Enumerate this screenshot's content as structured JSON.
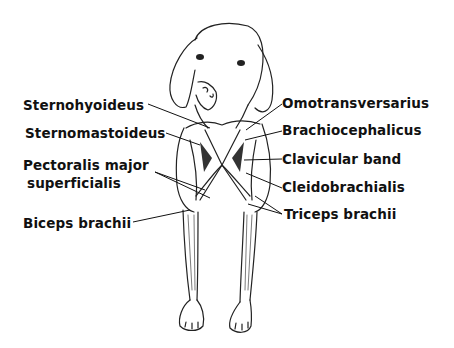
{
  "labels_left": [
    {
      "id": "sternohyoideus",
      "text": "Sternohyoideus",
      "x": 23,
      "y": 98
    },
    {
      "id": "sternomastoideus",
      "text": "Sternomastoideus",
      "x": 25,
      "y": 126
    },
    {
      "id": "pectoralis-line1",
      "text": "Pectoralis major",
      "x": 23,
      "y": 158
    },
    {
      "id": "pectoralis-line2",
      "text": "superficialis",
      "x": 27,
      "y": 176
    },
    {
      "id": "biceps-brachii",
      "text": "Biceps brachii",
      "x": 23,
      "y": 216
    }
  ],
  "labels_right": [
    {
      "id": "omotransversarius",
      "text": "Omotransversarius",
      "x": 282,
      "y": 96
    },
    {
      "id": "brachiocephalicus",
      "text": "Brachiocephalicus",
      "x": 282,
      "y": 123
    },
    {
      "id": "clavicular-band",
      "text": "Clavicular band",
      "x": 282,
      "y": 152
    },
    {
      "id": "cleidobrachialis",
      "text": "Cleidobrachialis",
      "x": 282,
      "y": 180
    },
    {
      "id": "triceps-brachii",
      "text": "Triceps brachii",
      "x": 284,
      "y": 207
    }
  ],
  "colors": {
    "ink": "#1a1a1a",
    "line": "#222222",
    "shade": "#3a3a3a"
  }
}
